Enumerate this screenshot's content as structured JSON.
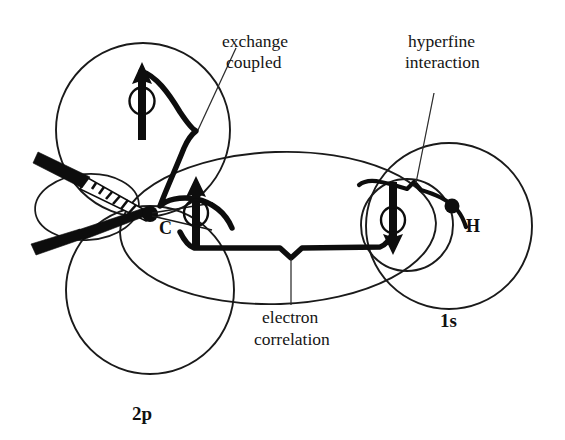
{
  "figure": {
    "background_color": "#ffffff",
    "ink_color": "#111111"
  },
  "annotations": {
    "exchange_coupled": {
      "line1": "exchange",
      "line2": "coupled"
    },
    "hyperfine": {
      "line1": "hyperfine",
      "line2": "interaction"
    },
    "electron_correlation": {
      "line1": "electron",
      "line2": "correlation"
    }
  },
  "atoms": [
    {
      "id": "carbon",
      "label": "C",
      "dot": true
    },
    {
      "id": "hydrogen",
      "label": "H",
      "dot": true
    }
  ],
  "orbital_labels": [
    {
      "id": "p-orbital",
      "label": "2p"
    },
    {
      "id": "s-orbital",
      "label": "1s"
    }
  ],
  "spins": [
    {
      "id": "spin-upper-p-lobe",
      "direction": "up",
      "glyph": "↑"
    },
    {
      "id": "spin-bonding-pair-carbon",
      "direction": "up",
      "glyph": "↑"
    },
    {
      "id": "spin-bonding-pair-hydrogen",
      "direction": "down",
      "glyph": "↓"
    }
  ],
  "bonds": [
    {
      "id": "bond-hashed-wedge",
      "style": "hashed-wedge"
    },
    {
      "id": "bond-solid-wedge",
      "style": "solid-wedge"
    }
  ]
}
